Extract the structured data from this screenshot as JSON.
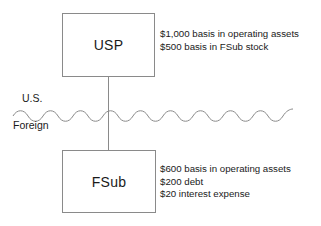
{
  "diagram": {
    "entities": [
      {
        "id": "usp",
        "label": "USP",
        "annotations": [
          "$1,000 basis in operating assets",
          "$500 basis in FSub stock"
        ]
      },
      {
        "id": "fsub",
        "label": "FSub",
        "annotations": [
          "$600 basis in operating assets",
          "$200 debt",
          "$20 interest expense"
        ]
      }
    ],
    "jurisdictions": {
      "above": "U.S.",
      "below": "Foreign"
    },
    "colors": {
      "box_stroke": "#8a8a8a",
      "wave_stroke": "#8a8a8a",
      "connector_stroke": "#8a8a8a",
      "text": "#1a1a1a",
      "background": "#ffffff"
    }
  }
}
